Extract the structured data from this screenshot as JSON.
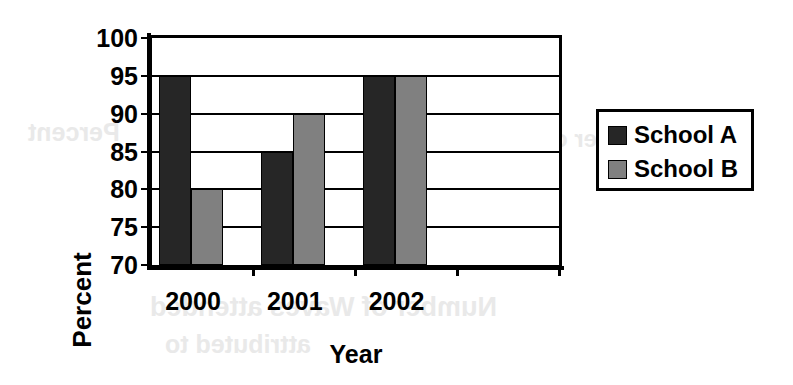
{
  "chart_data": {
    "type": "bar",
    "title": "",
    "subtitle": "",
    "xlabel": "Year",
    "ylabel": "Percent",
    "categories": [
      "2000",
      "2001",
      "2002",
      ""
    ],
    "series": [
      {
        "name": "School A",
        "color": "#262626",
        "values": [
          95,
          85,
          95,
          null
        ]
      },
      {
        "name": "School B",
        "color": "#808080",
        "values": [
          80,
          90,
          95,
          null
        ]
      }
    ],
    "ylim": [
      70,
      100
    ],
    "yticks": [
      70,
      75,
      80,
      85,
      90,
      95,
      100
    ],
    "ytick_labels": [
      "70",
      "75",
      "80",
      "85",
      "90",
      "95",
      "100"
    ],
    "grid": true,
    "grid_axis": "y",
    "legend": [
      "School A",
      "School B"
    ],
    "legend_position": "right",
    "bar_group_gap": true,
    "annotations": []
  },
  "axes": {
    "y_title": "Percent",
    "x_title": "Year"
  },
  "legend": {
    "entries": [
      {
        "label": "School A",
        "swatch": "dark-square-swatch",
        "color": "#262626"
      },
      {
        "label": "School B",
        "swatch": "gray-square-swatch",
        "color": "#808080"
      }
    ]
  },
  "background_artifacts": {
    "ghost_1": "Percent",
    "ghost_2": "Number of Waves attended",
    "ghost_3": "attributed to",
    "ghost_4": "Number of"
  }
}
